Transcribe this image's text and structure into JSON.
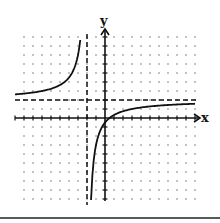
{
  "chart_data": {
    "type": "line",
    "title": "",
    "xlabel": "x",
    "ylabel": "y",
    "xlim": [
      -9,
      10
    ],
    "ylim": [
      -9,
      9
    ],
    "grid": "dotted",
    "function": "y = 2 - 5/(x + 2)",
    "asymptotes": {
      "vertical_x": -2,
      "horizontal_y": 2
    },
    "series": [
      {
        "name": "left-branch",
        "x_range": [
          -10,
          -2.75
        ]
      },
      {
        "name": "right-branch",
        "x_range": [
          -1.55,
          10
        ]
      }
    ]
  },
  "colors": {
    "curve": "#111111",
    "axis": "#111111",
    "grid_dot": "#777777",
    "asymptote": "#111111"
  }
}
